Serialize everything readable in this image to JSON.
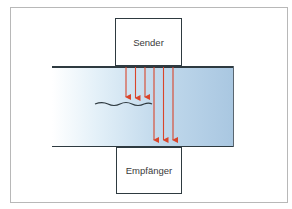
{
  "diagram": {
    "sender": {
      "label": "Sender"
    },
    "receiver": {
      "label": "Empfänger"
    },
    "colors": {
      "arrow": "#d9452b",
      "line": "#2e3a40",
      "medium_light": "#ffffff",
      "medium_dark": "#a9c7e1",
      "frame": "#b8b8b8"
    },
    "arrows": {
      "short_reflected": [
        126,
        135,
        145
      ],
      "long_transmitted": [
        154,
        163,
        173
      ]
    },
    "interface_line": "wavy-boundary"
  }
}
